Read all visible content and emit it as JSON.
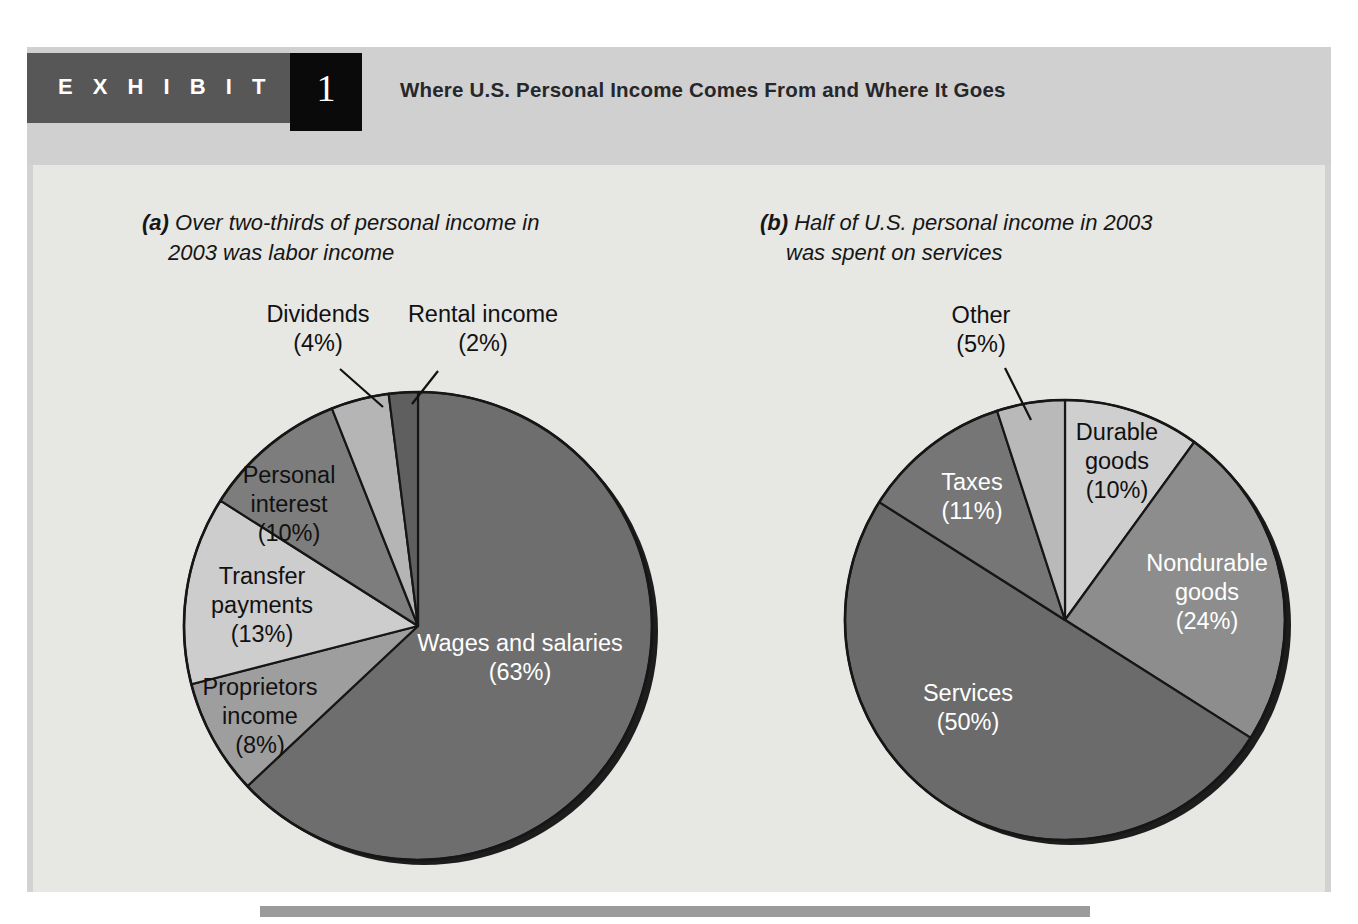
{
  "header": {
    "exhibit_word": "E X H I B I T",
    "exhibit_number": "1",
    "title": "Where U.S. Personal Income Comes From and Where It Goes"
  },
  "panels": {
    "a": {
      "marker": "(a)",
      "caption_line1": "Over two-thirds of personal income in",
      "caption_line2": "2003 was labor income"
    },
    "b": {
      "marker": "(b)",
      "caption_line1": "Half of U.S. personal income in 2003",
      "caption_line2": "was spent on services"
    }
  },
  "chart_data": [
    {
      "type": "pie",
      "id": "personal-income-sources",
      "title": "Over two-thirds of personal income in 2003 was labor income",
      "panel": "(a)",
      "start_angle_deg": 0,
      "direction": "clockwise",
      "categories": [
        "Wages and salaries",
        "Proprietors income",
        "Transfer payments",
        "Personal interest",
        "Dividends",
        "Rental income"
      ],
      "values": [
        63,
        8,
        13,
        10,
        4,
        2
      ],
      "unit": "percent",
      "slices": [
        {
          "label": "Wages and salaries",
          "value": 63,
          "value_text": "(63%)",
          "color": "#6e6e6e",
          "label_placement": "inside",
          "label_color": "light"
        },
        {
          "label": "Proprietors income",
          "value": 8,
          "value_text": "(8%)",
          "color": "#9e9e9e",
          "label_placement": "inside",
          "label_color": "dark"
        },
        {
          "label": "Transfer payments",
          "value": 13,
          "value_text": "(13%)",
          "color": "#cdcdcd",
          "label_placement": "inside",
          "label_color": "dark"
        },
        {
          "label": "Personal interest",
          "value": 10,
          "value_text": "(10%)",
          "color": "#7d7d7d",
          "label_placement": "inside",
          "label_color": "light"
        },
        {
          "label": "Dividends",
          "value": 4,
          "value_text": "(4%)",
          "color": "#b5b5b5",
          "label_placement": "callout",
          "label_color": "dark"
        },
        {
          "label": "Rental income",
          "value": 2,
          "value_text": "(2%)",
          "color": "#5f5f5f",
          "label_placement": "callout",
          "label_color": "dark"
        }
      ]
    },
    {
      "type": "pie",
      "id": "personal-income-uses",
      "title": "Half of U.S. personal income in 2003 was spent on services",
      "panel": "(b)",
      "start_angle_deg": 0,
      "direction": "clockwise",
      "categories": [
        "Durable goods",
        "Nondurable goods",
        "Services",
        "Taxes",
        "Other"
      ],
      "values": [
        10,
        24,
        50,
        11,
        5
      ],
      "unit": "percent",
      "slices": [
        {
          "label": "Durable goods",
          "value": 10,
          "value_text": "(10%)",
          "color": "#cfcfcf",
          "label_placement": "inside",
          "label_color": "dark"
        },
        {
          "label": "Nondurable goods",
          "value": 24,
          "value_text": "(24%)",
          "color": "#8d8d8d",
          "label_placement": "inside",
          "label_color": "light"
        },
        {
          "label": "Services",
          "value": 50,
          "value_text": "(50%)",
          "color": "#6b6b6b",
          "label_placement": "inside",
          "label_color": "light"
        },
        {
          "label": "Taxes",
          "value": 11,
          "value_text": "(11%)",
          "color": "#767676",
          "label_placement": "inside",
          "label_color": "light"
        },
        {
          "label": "Other",
          "value": 5,
          "value_text": "(5%)",
          "color": "#b9b9b9",
          "label_placement": "callout",
          "label_color": "dark"
        }
      ]
    }
  ],
  "labels": {
    "a": {
      "wages": "Wages and salaries",
      "wages_pct": "(63%)",
      "proprietors_l1": "Proprietors",
      "proprietors_l2": "income",
      "proprietors_pct": "(8%)",
      "transfer_l1": "Transfer",
      "transfer_l2": "payments",
      "transfer_pct": "(13%)",
      "interest_l1": "Personal",
      "interest_l2": "interest",
      "interest_pct": "(10%)",
      "dividends": "Dividends",
      "dividends_pct": "(4%)",
      "rental": "Rental income",
      "rental_pct": "(2%)"
    },
    "b": {
      "durable_l1": "Durable",
      "durable_l2": "goods",
      "durable_pct": "(10%)",
      "nondurable_l1": "Nondurable",
      "nondurable_l2": "goods",
      "nondurable_pct": "(24%)",
      "services": "Services",
      "services_pct": "(50%)",
      "taxes": "Taxes",
      "taxes_pct": "(11%)",
      "other": "Other",
      "other_pct": "(5%)"
    }
  },
  "colors": {
    "frame": "#d2d2d2",
    "plate": "#e7e7e4",
    "tab": "#575757",
    "number_box": "#0a0a0a",
    "rule": "#9b9b9b",
    "text": "#161616"
  }
}
